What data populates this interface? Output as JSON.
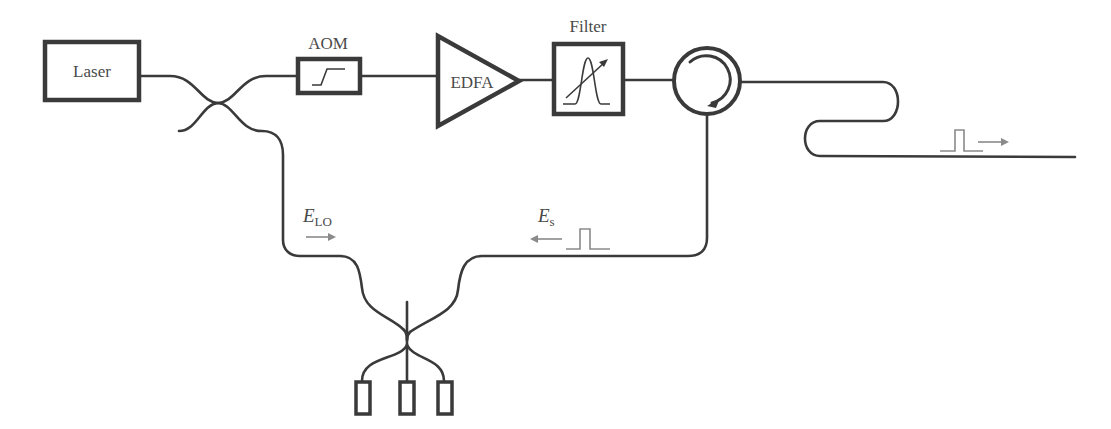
{
  "diagram": {
    "components": {
      "laser": {
        "label": "Laser"
      },
      "aom": {
        "label": "AOM"
      },
      "edfa": {
        "label": "EDFA"
      },
      "filter": {
        "label": "Filter"
      },
      "circulator": {
        "label": ""
      },
      "fiber_under_test": {
        "label": ""
      },
      "detectors": {
        "count": 3
      }
    },
    "signals": {
      "local_oscillator": {
        "symbol": "E",
        "subscript": "LO",
        "direction": "right"
      },
      "signal": {
        "symbol": "E",
        "subscript": "s",
        "direction": "left"
      },
      "probe_pulse": {
        "direction": "right"
      }
    },
    "colors": {
      "line": "#3a3a3a",
      "annotation": "#8a8a8a",
      "text": "#4a4a4a",
      "background": "#ffffff"
    }
  }
}
